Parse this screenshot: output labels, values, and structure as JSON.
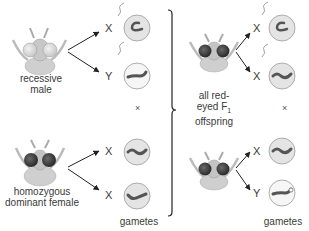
{
  "parents": {
    "male": {
      "label_line1": "recessive",
      "label_line2": "male",
      "gametes": [
        "X",
        "Y"
      ]
    },
    "female": {
      "label_line1": "homozygous",
      "label_line2": "dominant female",
      "gametes": [
        "X",
        "X"
      ]
    },
    "cross_symbol": "×",
    "gametes_label": "gametes"
  },
  "offspring": {
    "label_line1": "all red-",
    "label_line2": "eyed F",
    "label_sub": "1",
    "label_line3": "offspring",
    "male_gametes": [
      "X",
      "X"
    ],
    "female_gametes": [
      "X",
      "Y"
    ],
    "cross_symbol": "×",
    "gametes_label": "gametes"
  },
  "colors": {
    "cell_fill": "#e4e4e4",
    "cell_fill_light": "#f4f4f4",
    "cell_stroke": "#9a9a9a",
    "chromosome": "#555555",
    "bracket": "#222222"
  }
}
